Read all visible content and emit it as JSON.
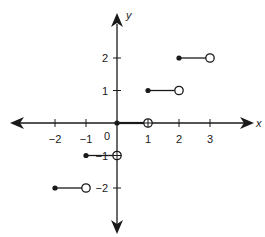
{
  "chart_data": {
    "type": "line",
    "title": "",
    "xlabel": "x",
    "ylabel": "y",
    "xlim": [
      -3.4,
      4.4
    ],
    "ylim": [
      -3.4,
      3.4
    ],
    "grid": false,
    "legend": null,
    "x_ticks": [
      -2,
      -1,
      1,
      2,
      3
    ],
    "y_ticks": [
      2,
      1,
      -1,
      -2
    ],
    "origin_label": "0",
    "segments": [
      {
        "x_start": -2,
        "x_end": -1,
        "y": -2,
        "start_closed": true,
        "end_closed": false
      },
      {
        "x_start": -1,
        "x_end": 0,
        "y": -1,
        "start_closed": true,
        "end_closed": false
      },
      {
        "x_start": 0,
        "x_end": 1,
        "y": 0,
        "start_closed": true,
        "end_closed": false
      },
      {
        "x_start": 1,
        "x_end": 2,
        "y": 1,
        "start_closed": true,
        "end_closed": false
      },
      {
        "x_start": 2,
        "x_end": 3,
        "y": 2,
        "start_closed": true,
        "end_closed": false
      }
    ]
  },
  "labels": {
    "x_axis": "x",
    "y_axis": "y",
    "origin": "0",
    "x_tick_labels": [
      "−2",
      "−1",
      "1",
      "2",
      "3"
    ],
    "y_tick_labels": [
      "2",
      "1",
      "−1",
      "−2"
    ]
  },
  "colors": {
    "ink": "#1a1a1a",
    "background": "#ffffff"
  }
}
